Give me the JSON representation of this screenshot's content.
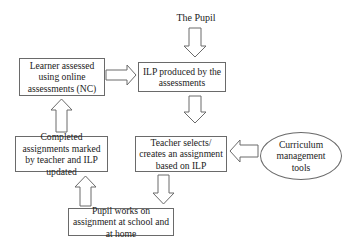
{
  "diagram": {
    "type": "flowchart",
    "start_label": "The Pupil",
    "nodes": {
      "learner_assessed": "Learner assessed using online assessments (NC)",
      "ilp_produced": "ILP produced by the assessments",
      "completed_assignments": "Completed assignments marked by teacher and ILP updated",
      "teacher_selects": "Teacher selects/ creates an assignment based on ILP",
      "pupil_works": "Pupil works on assignment at school and at home",
      "curriculum_tools": "Curriculum management tools"
    },
    "edges": [
      {
        "from": "The Pupil",
        "to": "ILP produced by the assessments"
      },
      {
        "from": "Learner assessed using online assessments (NC)",
        "to": "ILP produced by the assessments"
      },
      {
        "from": "ILP produced by the assessments",
        "to": "Teacher selects/ creates an assignment based on ILP"
      },
      {
        "from": "Curriculum management tools",
        "to": "Teacher selects/ creates an assignment based on ILP"
      },
      {
        "from": "Teacher selects/ creates an assignment based on ILP",
        "to": "Pupil works on assignment at school and at home"
      },
      {
        "from": "Pupil works on assignment at school and at home",
        "to": "Completed assignments marked by teacher and ILP updated"
      },
      {
        "from": "Completed assignments marked by teacher and ILP updated",
        "to": "Learner assessed using online assessments (NC)"
      }
    ]
  }
}
